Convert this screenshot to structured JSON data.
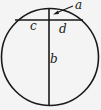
{
  "diagram": {
    "colors": {
      "stroke": "#1a1a1a",
      "background": "#f4f4f4"
    },
    "labels": {
      "a": "a",
      "b": "b",
      "c": "c",
      "d": "d"
    },
    "segments": [
      {
        "name": "a",
        "meaning": "upper part of vertical chord above horizontal chord"
      },
      {
        "name": "b",
        "meaning": "lower part of vertical chord below horizontal chord"
      },
      {
        "name": "c",
        "meaning": "left part of horizontal chord"
      },
      {
        "name": "d",
        "meaning": "right part of horizontal chord"
      }
    ]
  }
}
